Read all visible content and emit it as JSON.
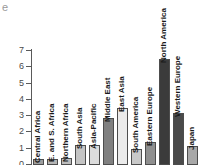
{
  "panel": {
    "label": "e"
  },
  "chart_data": {
    "type": "bar",
    "title": "",
    "xlabel": "",
    "ylabel": "",
    "ylim": [
      0,
      7
    ],
    "yticks": [
      0,
      1,
      2,
      3,
      4,
      5,
      6,
      7
    ],
    "ytick_labels": [
      "0",
      "1",
      "2",
      "3",
      "4",
      "5",
      "6",
      "7"
    ],
    "grid": false,
    "legend": "none",
    "categories": [
      "Central Africa",
      "E. and S. Africa",
      "Northern Africa",
      "South Asia",
      "Asia-Pacific",
      "Middle East",
      "East Asia",
      "South America",
      "Eastern Europe",
      "North America",
      "Western Europe",
      "Japan"
    ],
    "values": [
      0.35,
      0.4,
      0.45,
      1.25,
      1.2,
      2.9,
      3.5,
      1.0,
      1.4,
      6.5,
      3.2,
      1.15
    ],
    "bar_colors": [
      "#9e9e9e",
      "#b5b5b5",
      "#bdbdbd",
      "#c4c4c4",
      "#dcdcdc",
      "#808080",
      "#ebebeb",
      "#c9c9c9",
      "#8f8f8f",
      "#3b3b3b",
      "#4a4a4a",
      "#a8a8a8"
    ],
    "bar_edge_color": "#4d4d4d",
    "axis_color": "#5a5a5a"
  }
}
